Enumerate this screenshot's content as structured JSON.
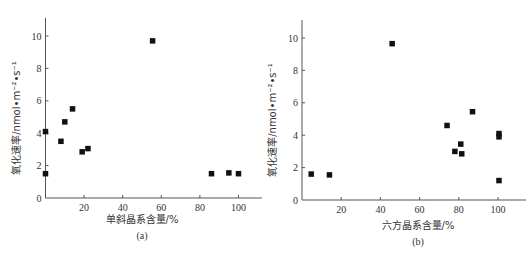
{
  "chart_data": [
    {
      "type": "scatter",
      "panel": "(a)",
      "title": "",
      "xlabel": "单斜晶系含量/%",
      "ylabel": "氧化速率/nmol•m⁻²•s⁻¹",
      "xlim": [
        0,
        110
      ],
      "ylim": [
        0,
        11
      ],
      "xticks": [
        20,
        40,
        60,
        80,
        100
      ],
      "yticks": [
        0,
        2,
        4,
        6,
        8,
        10
      ],
      "grid": false,
      "legend": null,
      "marker": "square",
      "points": [
        {
          "x": 0,
          "y": 1.5
        },
        {
          "x": 0,
          "y": 4.1
        },
        {
          "x": 8,
          "y": 3.5
        },
        {
          "x": 10,
          "y": 4.7
        },
        {
          "x": 14,
          "y": 5.5
        },
        {
          "x": 19,
          "y": 2.85
        },
        {
          "x": 22,
          "y": 3.05
        },
        {
          "x": 55.5,
          "y": 9.7
        },
        {
          "x": 86,
          "y": 1.5
        },
        {
          "x": 95,
          "y": 1.55
        },
        {
          "x": 100,
          "y": 1.5
        }
      ]
    },
    {
      "type": "scatter",
      "panel": "(b)",
      "title": "",
      "xlabel": "六方晶系含量/%",
      "ylabel": "氧化速率/nmol•m⁻²•s⁻¹",
      "xlim": [
        0,
        110
      ],
      "ylim": [
        0,
        11
      ],
      "xticks": [
        20,
        40,
        60,
        80,
        100
      ],
      "yticks": [
        0,
        2,
        4,
        6,
        8,
        10
      ],
      "grid": false,
      "legend": null,
      "marker": "square",
      "points": [
        {
          "x": 4.7,
          "y": 1.6
        },
        {
          "x": 14,
          "y": 1.55
        },
        {
          "x": 46,
          "y": 9.65
        },
        {
          "x": 74,
          "y": 4.6
        },
        {
          "x": 78,
          "y": 3.0
        },
        {
          "x": 81,
          "y": 3.45
        },
        {
          "x": 81.5,
          "y": 2.85
        },
        {
          "x": 87,
          "y": 5.45
        },
        {
          "x": 100.5,
          "y": 4.1
        },
        {
          "x": 100.5,
          "y": 3.9
        },
        {
          "x": 100.5,
          "y": 1.2
        }
      ]
    }
  ],
  "panels": [
    {
      "caption": "(a)",
      "xlabel": "单斜晶系含量/%",
      "ylabel": "氧化速率/nmol•m⁻²•s⁻¹",
      "layout": {
        "x0": 45.5,
        "y0": 198,
        "pxPerX": 1.93,
        "pxPerY": 16.2,
        "xEnd": 262,
        "yTop": 18,
        "xlabelX": 142,
        "xlabelY": 223,
        "captionX": 142,
        "captionY": 239,
        "ylabelX": 20,
        "ylabelY": 118
      }
    },
    {
      "caption": "(b)",
      "xlabel": "六方晶系含量/%",
      "ylabel": "氧化速率/nmol•m⁻²•s⁻¹",
      "layout": {
        "x0": 302,
        "y0": 200,
        "pxPerX": 1.96,
        "pxPerY": 16.2,
        "xEnd": 526,
        "yTop": 20,
        "xlabelX": 418,
        "xlabelY": 229,
        "captionX": 418,
        "captionY": 245,
        "ylabelX": 276,
        "ylabelY": 120
      }
    }
  ],
  "colors": {
    "marker": "#111111",
    "axis": "#555555",
    "text": "#333333"
  }
}
